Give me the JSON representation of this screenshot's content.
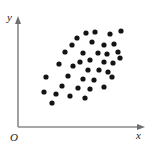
{
  "figure": {
    "background_color": "#ffffff",
    "width": 162,
    "height": 156
  },
  "axes": {
    "y_axis_label": "y",
    "x_axis_label": "x",
    "origin_label": "O",
    "axis_color": "#8a8a8a",
    "y_axis": {
      "x": 18,
      "y_top": 18,
      "y_bottom": 127
    },
    "x_axis": {
      "y": 127,
      "x_left": 18,
      "x_right": 143
    }
  },
  "points_style": {
    "color": "#141414",
    "radius": 2.6,
    "marker": "filled-circle"
  },
  "chart_data": {
    "type": "scatter",
    "title": "",
    "xlabel": "x",
    "ylabel": "y",
    "grid": false,
    "legend": null,
    "axis_arrows": true,
    "origin_label": "O",
    "xlim": [
      18,
      143
    ],
    "ylim": [
      127,
      18
    ],
    "n_points": 38,
    "series": [
      {
        "name": "observations",
        "color": "#141414",
        "points": [
          [
            77,
            38
          ],
          [
            86,
            33
          ],
          [
            95,
            32
          ],
          [
            110,
            34
          ],
          [
            121,
            31
          ],
          [
            72,
            45
          ],
          [
            92,
            42
          ],
          [
            104,
            45
          ],
          [
            114,
            44
          ],
          [
            118,
            52
          ],
          [
            65,
            52
          ],
          [
            83,
            53
          ],
          [
            98,
            53
          ],
          [
            107,
            54
          ],
          [
            120,
            58
          ],
          [
            80,
            62
          ],
          [
            90,
            60
          ],
          [
            104,
            62
          ],
          [
            113,
            63
          ],
          [
            59,
            64
          ],
          [
            73,
            66
          ],
          [
            88,
            70
          ],
          [
            99,
            70
          ],
          [
            108,
            72
          ],
          [
            46,
            77
          ],
          [
            68,
            76
          ],
          [
            83,
            79
          ],
          [
            94,
            80
          ],
          [
            112,
            77
          ],
          [
            62,
            86
          ],
          [
            78,
            88
          ],
          [
            90,
            89
          ],
          [
            104,
            87
          ],
          [
            44,
            92
          ],
          [
            56,
            94
          ],
          [
            70,
            96
          ],
          [
            85,
            98
          ],
          [
            52,
            103
          ]
        ]
      }
    ]
  }
}
